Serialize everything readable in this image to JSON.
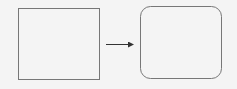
{
  "diagram": {
    "nodes": [
      {
        "id": "square",
        "shape": "rectangle",
        "label": ""
      },
      {
        "id": "rounded-square",
        "shape": "rounded-rectangle",
        "label": ""
      }
    ],
    "edges": [
      {
        "from": "square",
        "to": "rounded-square",
        "type": "arrow",
        "label": ""
      }
    ],
    "colors": {
      "background": "#f4f4f4",
      "stroke_square": "#777777",
      "stroke_rounded": "#777777",
      "arrow": "#333333"
    }
  }
}
